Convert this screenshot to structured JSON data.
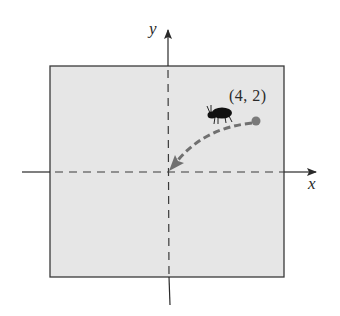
{
  "diagram": {
    "title": "",
    "axes": {
      "x_label": "x",
      "y_label": "y"
    },
    "point": {
      "label": "(4, 2)",
      "x": 4,
      "y": 2
    },
    "path": {
      "from": "(4, 2)",
      "to": "origin",
      "style": "dashed curved arrow"
    },
    "icons": [
      "bug-icon"
    ],
    "colors": {
      "region_fill": "#e6e6e6",
      "region_border": "#3a3a3a",
      "axis": "#2a2a2a",
      "path": "#707070",
      "point": "#7a7a7a",
      "bug": "#111111"
    }
  }
}
